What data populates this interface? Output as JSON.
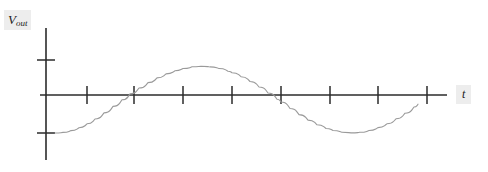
{
  "figure": {
    "title": "",
    "background_color": "#ffffff",
    "width": 488,
    "height": 172
  },
  "labels": {
    "y_axis_main": "V",
    "y_axis_sub": "out",
    "y_axis_full": "Vout",
    "x_axis": "t",
    "label_highlight_color": "#ededed",
    "label_text_color": "#1a1a1a"
  },
  "axes": {
    "origin_x": 46,
    "origin_y": 95,
    "x_axis_start": 40,
    "x_axis_end": 447,
    "y_axis_top": 28,
    "y_axis_bottom": 160,
    "axis_color": "#2b2b2b",
    "x_tick_positions": [
      87,
      134,
      183,
      232,
      281,
      330,
      378,
      427
    ],
    "x_tick_half_length": 9,
    "y_tick_positions": [
      60,
      133
    ],
    "y_tick_half_length": 9
  },
  "chart_data": {
    "type": "line",
    "title": "",
    "xlabel": "t",
    "ylabel": "Vout",
    "grid": false,
    "legend": null,
    "curve_color": "#9a9a9a",
    "waveform": {
      "shape": "sine",
      "amplitude_px": 37,
      "period_px": 202,
      "phase": "starts at negative peak (minimum) at left edge of curve",
      "baseline_y": 95,
      "curve_start_x": 55,
      "curve_end_x": 418,
      "cycles_shown": 1.8
    },
    "key_points": [
      {
        "label": "start trough",
        "x": 55,
        "y": 133,
        "value": -1
      },
      {
        "label": "zero crossing rising",
        "x": 87,
        "y": 95,
        "value": 0
      },
      {
        "label": "peak 1",
        "x": 130,
        "y": 58,
        "value": 1
      },
      {
        "label": "zero crossing falling",
        "x": 183,
        "y": 95,
        "value": 0
      },
      {
        "label": "trough 1",
        "x": 232,
        "y": 133,
        "value": -1
      },
      {
        "label": "zero crossing rising",
        "x": 281,
        "y": 95,
        "value": 0
      },
      {
        "label": "peak 2",
        "x": 333,
        "y": 58,
        "value": 1
      },
      {
        "label": "zero crossing falling",
        "x": 378,
        "y": 95,
        "value": 0
      },
      {
        "label": "end descending",
        "x": 418,
        "y": 130,
        "value": -0.95
      }
    ],
    "x": [
      55,
      63,
      71,
      79,
      87,
      95,
      104,
      113,
      122,
      130,
      139,
      148,
      157,
      166,
      175,
      183,
      192,
      201,
      210,
      219,
      228,
      232,
      241,
      250,
      259,
      268,
      277,
      281,
      290,
      299,
      308,
      317,
      326,
      333,
      342,
      351,
      360,
      369,
      378,
      387,
      396,
      405,
      414,
      418
    ],
    "y": [
      133,
      132.4,
      130.6,
      127.7,
      123.8,
      119.0,
      112.9,
      106.4,
      99.8,
      93.9,
      88.0,
      82.6,
      77.9,
      73.9,
      70.7,
      68.5,
      66.8,
      66.3,
      66.9,
      68.5,
      71.2,
      72.7,
      76.7,
      81.5,
      87.0,
      93.0,
      99.3,
      102.0,
      108.5,
      114.6,
      120.1,
      124.8,
      128.5,
      130.5,
      132.3,
      132.9,
      132.3,
      130.5,
      127.6,
      123.7,
      118.8,
      113.2,
      107.0,
      104.2
    ]
  }
}
